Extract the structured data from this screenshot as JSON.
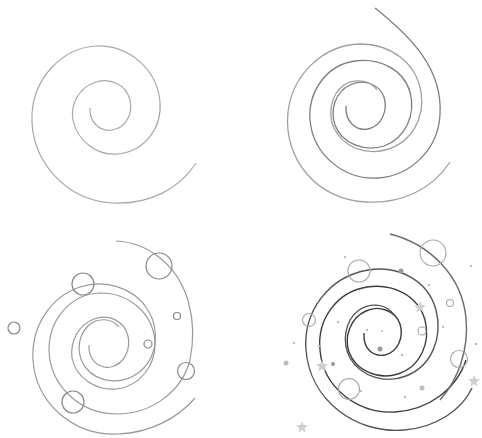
{
  "title": "How to draw a spiral galaxy - 4 steps",
  "background": "#ffffff",
  "panels": [
    {
      "step": 1,
      "description": "Simple spiral, 2 turns",
      "stroke": "#a8a8a8",
      "center": [
        107,
        109
      ]
    },
    {
      "step": 2,
      "description": "Double-arm spiral with outer arc",
      "stroke": "#8a8a8a",
      "center": [
        365,
        112
      ]
    },
    {
      "step": 3,
      "description": "Spiral with circles (planets)",
      "stroke": "#9a9a9a",
      "center": [
        105,
        345
      ]
    },
    {
      "step": 4,
      "description": "Finished spiral with planets, dots and stars",
      "stroke": "#444444",
      "accent": "#bdbdbd",
      "center": [
        382,
        335
      ]
    }
  ],
  "icons": [
    "spiral",
    "circle",
    "dot",
    "star-icon"
  ]
}
